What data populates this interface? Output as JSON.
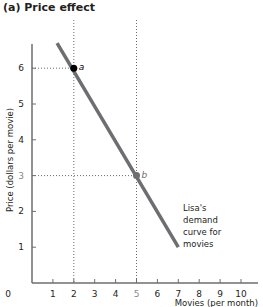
{
  "chart_data": {
    "type": "line",
    "title": "(a)  Price effect",
    "xlabel": "Movies (per month)",
    "ylabel": "Price (dollars per movie)",
    "xlim": [
      0,
      10.8
    ],
    "ylim": [
      0,
      6.7
    ],
    "x_ticks": [
      "0",
      "1",
      "2",
      "3",
      "4",
      "5",
      "6",
      "7",
      "8",
      "9",
      "10"
    ],
    "y_ticks": [
      "1",
      "2",
      "3",
      "4",
      "5",
      "6"
    ],
    "grid": false,
    "series": [
      {
        "name": "Lisa's demand curve for movies",
        "x": [
          1.2,
          7
        ],
        "y": [
          6.7,
          1
        ],
        "color": "#6d6e71"
      }
    ],
    "points": [
      {
        "label": "a",
        "x": 2,
        "y": 6,
        "color": "#000000"
      },
      {
        "label": "b",
        "x": 5,
        "y": 3,
        "color": "#6d6e71"
      }
    ],
    "annotation": [
      "Lisa's",
      "demand",
      "curve for",
      "movies"
    ]
  }
}
